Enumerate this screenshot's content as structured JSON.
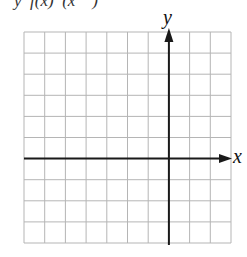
{
  "header": {
    "cropped_text": "y  f(x)  (x    )"
  },
  "axes": {
    "x_label": "x",
    "y_label": "y"
  },
  "grid": {
    "columns": 10,
    "rows": 10,
    "left": 24,
    "top": 32,
    "right": 231,
    "bottom": 243,
    "y_axis_column": 7,
    "x_axis_row": 6,
    "grid_color": "#b5b5b5",
    "axis_color": "#1a1a1a"
  }
}
